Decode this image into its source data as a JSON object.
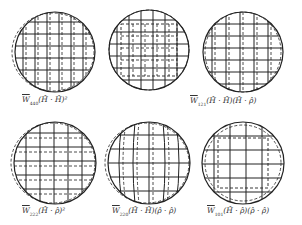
{
  "figure": {
    "panels": [
      {
        "id": "w440",
        "cx": 55,
        "cy": 52,
        "r": 40,
        "pattern": "grid-vertical-shift",
        "label_pre": "W",
        "label_sub": "440",
        "label_expr": "(Ĥ · Ĥ)²",
        "lx": 22,
        "ly": 96
      },
      {
        "id": "w121",
        "cx": 149,
        "cy": 50,
        "r": 40,
        "pattern": "grid-inner-square",
        "label_pre": "W",
        "label_sub": "121",
        "label_expr": "(Ĥ · Ĥ)(Ĥ · ρ̂)",
        "lx": 192,
        "ly": 96
      },
      {
        "id": "w222",
        "cx": 243,
        "cy": 52,
        "r": 40,
        "pattern": "grid-vertical-shift",
        "label_pre": "W",
        "label_sub": "222",
        "label_expr": "(Ĥ · ρ̂)²",
        "lx": 22,
        "ly": 206
      },
      {
        "id": "w220",
        "cx": 55,
        "cy": 163,
        "r": 41,
        "pattern": "grid-horizontal-shift",
        "label_pre": "W",
        "label_sub": "220",
        "label_expr": "(Ĥ · Ĥ)(ρ̂ · ρ̂)",
        "lx": 112,
        "ly": 206
      },
      {
        "id": "w101",
        "cx": 149,
        "cy": 163,
        "r": 41,
        "pattern": "grid-curved",
        "label_pre": "W",
        "label_sub": "101",
        "label_expr": "(Ĥ · ρ̂)(ρ̂ · ρ̂)",
        "lx": 207,
        "ly": 206
      },
      {
        "id": "w000",
        "cx": 243,
        "cy": 163,
        "r": 41,
        "pattern": "grid-inner-square",
        "label_pre": "",
        "label_sub": "",
        "label_expr": "",
        "lx": 0,
        "ly": 0
      }
    ],
    "labels": [
      {
        "text_w": "W",
        "sub": "440",
        "expr": "(Ĥ · Ĥ)²"
      },
      {
        "text_w": "W",
        "sub": "121",
        "expr": "(Ĥ · Ĥ)(Ĥ · ρ̂)"
      },
      {
        "text_w": "W",
        "sub": "222",
        "expr": "(Ĥ · ρ̂)²"
      },
      {
        "text_w": "W",
        "sub": "220",
        "expr": "(Ĥ · Ĥ)(ρ̂ · ρ̂)"
      },
      {
        "text_w": "W",
        "sub": "101",
        "expr": "(Ĥ · ρ̂)(ρ̂ · ρ̂)"
      }
    ],
    "colors": {
      "line": "#222222",
      "background": "#ffffff"
    }
  }
}
